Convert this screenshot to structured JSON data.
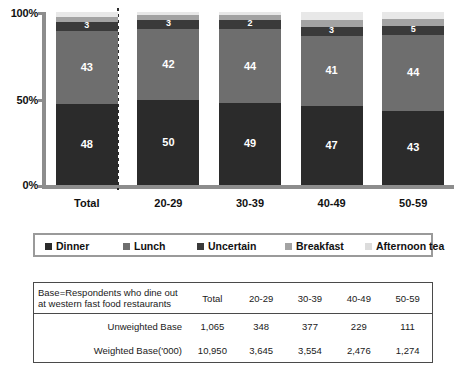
{
  "chart_data": {
    "type": "bar",
    "subtype": "stacked-100-percent-vertical",
    "title": "",
    "xlabel": "",
    "ylabel": "",
    "ylim": [
      0,
      100
    ],
    "ytick_labels": [
      "0%",
      "50%",
      "100%"
    ],
    "ytick_values": [
      0,
      50,
      100
    ],
    "grid": false,
    "legend_position": "below-plot",
    "categories": [
      "Total",
      "20-29",
      "30-39",
      "40-49",
      "50-59"
    ],
    "series": [
      {
        "name": "Dinner",
        "color": "#2b2b2b",
        "values": [
          48,
          50,
          49,
          47,
          43
        ]
      },
      {
        "name": "Lunch",
        "color": "#6e6e6e",
        "values": [
          43,
          42,
          44,
          41,
          44
        ]
      },
      {
        "name": "Uncertain",
        "color": "#3a3a3a",
        "values": [
          3,
          3,
          2,
          3,
          5
        ]
      },
      {
        "name": "Breakfast",
        "color": "#a3a3a3",
        "values": [
          3,
          3,
          3,
          4,
          4
        ]
      },
      {
        "name": "Afternoon tea",
        "color": "#e8e8e8",
        "values": [
          3,
          2,
          2,
          5,
          4
        ]
      }
    ],
    "visible_data_labels": {
      "Dinner": [
        "48",
        "50",
        "49",
        "47",
        "43"
      ],
      "Lunch": [
        "43",
        "42",
        "44",
        "41",
        "44"
      ],
      "Uncertain": [
        "3",
        "3",
        "2",
        "3",
        "5"
      ]
    },
    "annotations": [
      "dotted vertical divider between Total and 20-29"
    ]
  },
  "legend": {
    "items": [
      {
        "label": "Dinner",
        "color": "#2b2b2b"
      },
      {
        "label": "Lunch",
        "color": "#6e6e6e"
      },
      {
        "label": "Uncertain",
        "color": "#3a3a3a"
      },
      {
        "label": "Breakfast",
        "color": "#a3a3a3"
      },
      {
        "label": "Afternoon tea",
        "color": "#dcdcdc"
      }
    ]
  },
  "base_table": {
    "header_line1": "Base=Respondents who dine out",
    "header_line2": "at western fast food restaurants",
    "columns": [
      "Total",
      "20-29",
      "30-39",
      "40-49",
      "50-59"
    ],
    "rows": [
      {
        "label": "Unweighted Base",
        "values": [
          "1,065",
          "348",
          "377",
          "229",
          "111"
        ]
      },
      {
        "label": "Weighted Base('000)",
        "values": [
          "10,950",
          "3,645",
          "3,554",
          "2,476",
          "1,274"
        ]
      }
    ]
  }
}
